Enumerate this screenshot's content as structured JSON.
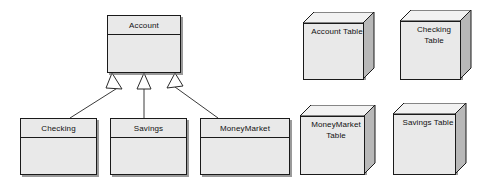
{
  "diagram": {
    "type": "uml-class-diagram",
    "colors": {
      "shape_fill": "#e9e9e9",
      "shape_top_fill": "#f2f2f2",
      "shape_side_fill": "#b8b8b8",
      "outline": "#1a1a1a",
      "shadow": "#787878",
      "background": "#ffffff",
      "arrow_fill": "#ffffff"
    }
  },
  "classes": [
    {
      "id": "account",
      "name": "Account",
      "role": "superclass",
      "x": 107,
      "y": 15,
      "w": 74,
      "h": 58
    },
    {
      "id": "checking",
      "name": "Checking",
      "role": "subclass",
      "x": 20,
      "y": 118,
      "w": 77,
      "h": 57
    },
    {
      "id": "savings",
      "name": "Savings",
      "role": "subclass",
      "x": 110,
      "y": 118,
      "w": 77,
      "h": 57
    },
    {
      "id": "moneymarket",
      "name": "MoneyMarket",
      "role": "subclass",
      "x": 200,
      "y": 118,
      "w": 90,
      "h": 57
    }
  ],
  "generalizations": [
    {
      "from": "checking",
      "to": "account",
      "arrowhead": "hollow-triangle"
    },
    {
      "from": "savings",
      "to": "account",
      "arrowhead": "hollow-triangle"
    },
    {
      "from": "moneymarket",
      "to": "account",
      "arrowhead": "hollow-triangle"
    }
  ],
  "tables": [
    {
      "id": "account-table",
      "label": "Account Table",
      "lines": [
        "Account Table"
      ],
      "x": 303,
      "y": 12,
      "w": 72,
      "h": 68
    },
    {
      "id": "checking-table",
      "label": "Checking Table",
      "lines": [
        "Checking",
        "Table"
      ],
      "x": 400,
      "y": 10,
      "w": 72,
      "h": 70
    },
    {
      "id": "moneymarket-table",
      "label": "MoneyMarket Table",
      "lines": [
        "MoneyMarket",
        "Table"
      ],
      "x": 300,
      "y": 105,
      "w": 76,
      "h": 70
    },
    {
      "id": "savings-table",
      "label": "Savings Table",
      "lines": [
        "Savings Table"
      ],
      "x": 393,
      "y": 103,
      "w": 74,
      "h": 72
    }
  ]
}
